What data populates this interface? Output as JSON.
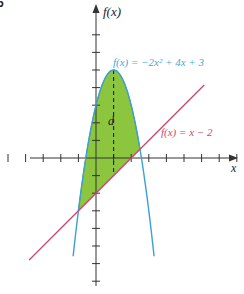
{
  "figure": {
    "corner_label": "5",
    "y_axis_label": "f(x)",
    "x_axis_label": "x",
    "region_label": "d",
    "curve_label": "f(x) = −2x² + 4x + 3",
    "line_label": "f(x) = x − 2",
    "colors": {
      "parabola": "#3aa0d8",
      "line": "#d0466b",
      "fill": "#8cc63f",
      "fill_stroke": "#5a8a2a",
      "axis": "#333333",
      "curve_label": "#4aa8d8",
      "line_label": "#d0466b"
    }
  },
  "chart_data": {
    "type": "line",
    "title": "",
    "xlabel": "x",
    "ylabel": "f(x)",
    "series": [
      {
        "name": "f(x) = -2x^2 + 4x + 3",
        "expression": "-2x^2+4x+3",
        "vertex": [
          1,
          5
        ]
      },
      {
        "name": "f(x) = x - 2",
        "expression": "x-2"
      }
    ],
    "intersections": [
      [
        -1,
        -3
      ],
      [
        2.5,
        0.5
      ]
    ],
    "shaded_region": {
      "between": [
        "f(x) = -2x^2 + 4x + 3",
        "f(x) = x - 2"
      ],
      "x_range": [
        -1,
        2.5
      ]
    },
    "vertical_segment": {
      "label": "d",
      "x": 1,
      "from_y": -1,
      "to_y": 5,
      "style": "dashed"
    },
    "xlim": [
      -5.5,
      8
    ],
    "ylim": [
      -7,
      7
    ],
    "tick_spacing": 1,
    "grid": false
  }
}
